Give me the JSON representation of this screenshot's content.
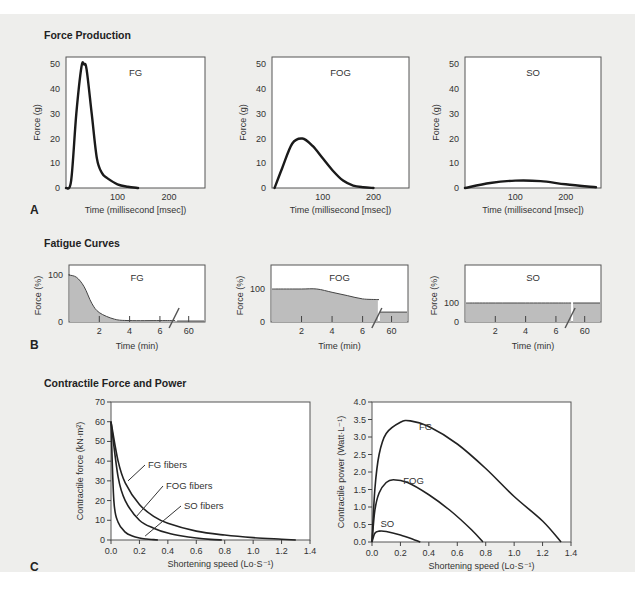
{
  "sections": {
    "a_title": "Force Production",
    "b_title": "Fatigue Curves",
    "c_title": "Contractile Force and Power",
    "a_letter": "A",
    "b_letter": "B",
    "c_letter": "C"
  },
  "chart_data": [
    {
      "panel": "A",
      "type": "line",
      "title": "FG",
      "xlabel": "Time (millisecond [msec])",
      "ylabel": "Force (g)",
      "xlim": [
        0,
        270
      ],
      "ylim": [
        0,
        53
      ],
      "xticks": [
        100,
        200
      ],
      "yticks": [
        0,
        10,
        20,
        30,
        40,
        50
      ],
      "x": [
        0,
        10,
        20,
        30,
        35,
        40,
        50,
        60,
        70,
        80,
        100,
        120,
        140
      ],
      "y": [
        0,
        3,
        30,
        49,
        50,
        48,
        30,
        12,
        6,
        4,
        1.5,
        0.5,
        0
      ]
    },
    {
      "panel": "A",
      "type": "line",
      "title": "FOG",
      "xlabel": "Time (millisecond [msec])",
      "ylabel": "Force (g)",
      "xlim": [
        0,
        270
      ],
      "ylim": [
        0,
        53
      ],
      "xticks": [
        100,
        200
      ],
      "yticks": [
        0,
        10,
        20,
        30,
        40,
        50
      ],
      "x": [
        5,
        20,
        40,
        60,
        80,
        100,
        120,
        140,
        160,
        180,
        200
      ],
      "y": [
        0,
        8,
        18,
        20,
        17,
        12,
        7,
        3,
        1,
        0.3,
        0
      ]
    },
    {
      "panel": "A",
      "type": "line",
      "title": "SO",
      "xlabel": "Time (millisecond [msec])",
      "ylabel": "Force (g)",
      "xlim": [
        0,
        270
      ],
      "ylim": [
        0,
        53
      ],
      "xticks": [
        100,
        200
      ],
      "yticks": [
        0,
        10,
        20,
        30,
        40,
        50
      ],
      "x": [
        0,
        50,
        100,
        150,
        200,
        260
      ],
      "y": [
        0,
        2,
        3,
        2.8,
        1.5,
        0.3
      ]
    },
    {
      "panel": "B",
      "type": "area",
      "title": "FG",
      "xlabel": "Time (min)",
      "ylabel": "Force (%)",
      "xticks": [
        "2",
        "4",
        "6",
        "60"
      ],
      "yticks": [
        0,
        100
      ],
      "axis_break": true,
      "x": [
        0,
        0.5,
        1,
        1.5,
        2,
        3,
        4,
        6,
        60
      ],
      "y": [
        100,
        95,
        75,
        40,
        20,
        6,
        3,
        3,
        2
      ]
    },
    {
      "panel": "B",
      "type": "area",
      "title": "FOG",
      "xlabel": "Time (min)",
      "ylabel": "Force (%)",
      "xticks": [
        "2",
        "4",
        "6",
        "60"
      ],
      "yticks": [
        0,
        100
      ],
      "axis_break": true,
      "x": [
        0.5,
        2,
        3,
        4,
        5,
        6,
        7,
        60
      ],
      "y": [
        100,
        100,
        100,
        90,
        80,
        70,
        68,
        30
      ]
    },
    {
      "panel": "B",
      "type": "area",
      "title": "SO",
      "xlabel": "Time (min)",
      "ylabel": "Force (%)",
      "xticks": [
        "2",
        "4",
        "6",
        "60"
      ],
      "yticks": [
        0,
        100
      ],
      "axis_break": true,
      "x": [
        0.5,
        2,
        4,
        6,
        60
      ],
      "y": [
        100,
        100,
        100,
        100,
        100
      ]
    },
    {
      "panel": "C",
      "type": "line",
      "xlabel": "Shortening speed (Lo·S⁻¹)",
      "ylabel": "Contractile force (kN·m²)",
      "xlim": [
        0,
        1.4
      ],
      "ylim": [
        0,
        70
      ],
      "xticks": [
        "0.0",
        "0.2",
        "0.4",
        "0.6",
        "0.8",
        "1.0",
        "1.2",
        "1.4"
      ],
      "yticks": [
        0,
        10,
        20,
        30,
        40,
        50,
        60,
        70
      ],
      "series": [
        {
          "name": "FG fibers",
          "x": [
            0,
            0.05,
            0.1,
            0.2,
            0.3,
            0.4,
            0.6,
            0.8,
            1.0,
            1.2,
            1.3
          ],
          "y": [
            60,
            40,
            29,
            18,
            12,
            8.5,
            4.5,
            2.5,
            1.2,
            0.4,
            0
          ]
        },
        {
          "name": "FOG fibers",
          "x": [
            0,
            0.05,
            0.1,
            0.2,
            0.3,
            0.4,
            0.5,
            0.6,
            0.7,
            0.78
          ],
          "y": [
            60,
            32,
            20,
            10,
            6,
            3.5,
            2,
            1,
            0.3,
            0
          ]
        },
        {
          "name": "SO fibers",
          "x": [
            0,
            0.02,
            0.05,
            0.1,
            0.15,
            0.2,
            0.25,
            0.3,
            0.33
          ],
          "y": [
            60,
            20,
            9,
            4,
            2,
            1,
            0.5,
            0.2,
            0
          ]
        }
      ]
    },
    {
      "panel": "C",
      "type": "line",
      "xlabel": "Shortening speed (Lo·S⁻¹)",
      "ylabel": "Contractile power (Watt·L⁻¹)",
      "xlim": [
        0,
        1.4
      ],
      "ylim": [
        0,
        4.0
      ],
      "xticks": [
        "0.0",
        "0.2",
        "0.4",
        "0.6",
        "0.8",
        "1.0",
        "1.2",
        "1.4"
      ],
      "yticks": [
        "0.0",
        "0.5",
        "1.0",
        "1.5",
        "2.0",
        "2.5",
        "3.0",
        "3.5",
        "4.0"
      ],
      "series": [
        {
          "name": "FG",
          "x": [
            0,
            0.02,
            0.05,
            0.1,
            0.2,
            0.27,
            0.4,
            0.6,
            0.8,
            1.0,
            1.2,
            1.33
          ],
          "y": [
            0,
            1.5,
            2.5,
            3.1,
            3.42,
            3.46,
            3.3,
            2.8,
            2.1,
            1.3,
            0.6,
            0
          ]
        },
        {
          "name": "FOG",
          "x": [
            0,
            0.02,
            0.05,
            0.1,
            0.15,
            0.25,
            0.4,
            0.55,
            0.7,
            0.78
          ],
          "y": [
            0,
            0.9,
            1.4,
            1.7,
            1.78,
            1.7,
            1.35,
            0.9,
            0.35,
            0
          ]
        },
        {
          "name": "SO",
          "x": [
            0,
            0.02,
            0.05,
            0.1,
            0.2,
            0.3,
            0.34
          ],
          "y": [
            0,
            0.25,
            0.31,
            0.3,
            0.2,
            0.06,
            0
          ]
        }
      ]
    }
  ],
  "labels": {
    "a_fg": "FG",
    "a_fog": "FOG",
    "a_so": "SO",
    "a_ylabel": "Force (g)",
    "a_xlabel": "Time (millisecond [msec])",
    "b_fg": "FG",
    "b_fog": "FOG",
    "b_so": "SO",
    "b_ylabel": "Force (%)",
    "b_xlabel": "Time (min)",
    "c_fg_fibers": "FG fibers",
    "c_fog_fibers": "FOG fibers",
    "c_so_fibers": "SO fibers",
    "c_left_ylabel": "Contractile force (kN·m²)",
    "c_right_ylabel": "Contractile power (Watt·L⁻¹)",
    "c_xlabel": "Shortening speed (Lo·S⁻¹)",
    "c_fg": "FG",
    "c_fog": "FOG",
    "c_so": "SO"
  }
}
